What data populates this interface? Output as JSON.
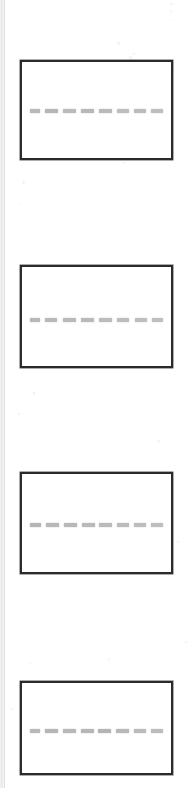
{
  "image": {
    "kind": "scanned-figure",
    "description": "Gel electrophoresis figure with four panels",
    "width": 193,
    "height": 788,
    "background_color": "#ffffff",
    "scan_edge_color": "#ededed"
  },
  "style": {
    "panel_border_color": "#2b2b2b",
    "panel_border_width": 2,
    "panel_fill_color": "#ffffff",
    "band_color": "#8a8a8a",
    "band_height": 4
  },
  "chart_data": {
    "type": "table",
    "title": "",
    "xlabel": "",
    "ylabel": "",
    "panel_count": 4,
    "lanes_per_panel": 8,
    "panels": [
      {
        "id": "panel-1",
        "label": "",
        "x": 20,
        "y": 60,
        "width": 153,
        "height": 100,
        "band_row_y": 46,
        "lanes": [
          {
            "lane": 1,
            "width": 10,
            "intensity": 0.6
          },
          {
            "lane": 2,
            "width": 13,
            "intensity": 0.62
          },
          {
            "lane": 3,
            "width": 13,
            "intensity": 0.58
          },
          {
            "lane": 4,
            "width": 13,
            "intensity": 0.6
          },
          {
            "lane": 5,
            "width": 13,
            "intensity": 0.58
          },
          {
            "lane": 6,
            "width": 12,
            "intensity": 0.56
          },
          {
            "lane": 7,
            "width": 12,
            "intensity": 0.57
          },
          {
            "lane": 8,
            "width": 12,
            "intensity": 0.55
          }
        ]
      },
      {
        "id": "panel-2",
        "label": "",
        "x": 20,
        "y": 265,
        "width": 153,
        "height": 103,
        "band_row_y": 50,
        "lanes": [
          {
            "lane": 1,
            "width": 10,
            "intensity": 0.6
          },
          {
            "lane": 2,
            "width": 12,
            "intensity": 0.6
          },
          {
            "lane": 3,
            "width": 13,
            "intensity": 0.58
          },
          {
            "lane": 4,
            "width": 13,
            "intensity": 0.58
          },
          {
            "lane": 5,
            "width": 13,
            "intensity": 0.57
          },
          {
            "lane": 6,
            "width": 12,
            "intensity": 0.56
          },
          {
            "lane": 7,
            "width": 12,
            "intensity": 0.55
          },
          {
            "lane": 8,
            "width": 11,
            "intensity": 0.54
          }
        ]
      },
      {
        "id": "panel-3",
        "label": "",
        "x": 20,
        "y": 472,
        "width": 153,
        "height": 102,
        "band_row_y": 48,
        "lanes": [
          {
            "lane": 1,
            "width": 11,
            "intensity": 0.62
          },
          {
            "lane": 2,
            "width": 13,
            "intensity": 0.6
          },
          {
            "lane": 3,
            "width": 13,
            "intensity": 0.6
          },
          {
            "lane": 4,
            "width": 13,
            "intensity": 0.59
          },
          {
            "lane": 5,
            "width": 13,
            "intensity": 0.58
          },
          {
            "lane": 6,
            "width": 12,
            "intensity": 0.57
          },
          {
            "lane": 7,
            "width": 12,
            "intensity": 0.56
          },
          {
            "lane": 8,
            "width": 12,
            "intensity": 0.55
          }
        ]
      },
      {
        "id": "panel-4",
        "label": "",
        "x": 20,
        "y": 681,
        "width": 153,
        "height": 94,
        "band_row_y": 45,
        "lanes": [
          {
            "lane": 1,
            "width": 10,
            "intensity": 0.6
          },
          {
            "lane": 2,
            "width": 13,
            "intensity": 0.62
          },
          {
            "lane": 3,
            "width": 13,
            "intensity": 0.6
          },
          {
            "lane": 4,
            "width": 13,
            "intensity": 0.62
          },
          {
            "lane": 5,
            "width": 13,
            "intensity": 0.63
          },
          {
            "lane": 6,
            "width": 13,
            "intensity": 0.6
          },
          {
            "lane": 7,
            "width": 12,
            "intensity": 0.58
          },
          {
            "lane": 8,
            "width": 12,
            "intensity": 0.57
          }
        ]
      }
    ]
  }
}
